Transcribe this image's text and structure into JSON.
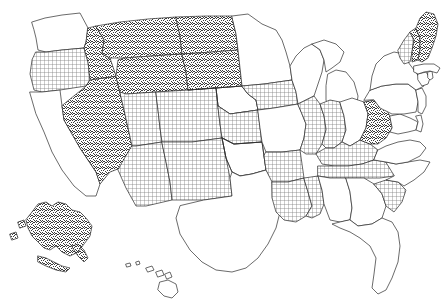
{
  "map": {
    "title": "United States Choropleth Map",
    "projection": "albers-usa",
    "background_color": "#ffffff",
    "outline_color": "#2b2b2b",
    "legend_categories": [
      {
        "key": "stipple",
        "label": "Stippled",
        "pattern": "random-dot-noise",
        "color": "#5a5a5a"
      },
      {
        "key": "crosshatch",
        "label": "Crosshatched",
        "pattern": "fine-grid",
        "color": "#8a8a8a"
      },
      {
        "key": "none",
        "label": "Unfilled",
        "pattern": "solid-white",
        "color": "#ffffff"
      }
    ]
  },
  "chart_data": {
    "type": "map",
    "xlabel": "",
    "ylabel": "",
    "categories": [
      "stipple",
      "crosshatch",
      "none"
    ],
    "counts": {
      "stipple": 12,
      "crosshatch": 17,
      "none": 22
    },
    "states": [
      {
        "code": "WA",
        "name": "Washington",
        "fill": "none"
      },
      {
        "code": "OR",
        "name": "Oregon",
        "fill": "crosshatch"
      },
      {
        "code": "CA",
        "name": "California",
        "fill": "none"
      },
      {
        "code": "NV",
        "name": "Nevada",
        "fill": "stipple"
      },
      {
        "code": "ID",
        "name": "Idaho",
        "fill": "stipple"
      },
      {
        "code": "MT",
        "name": "Montana",
        "fill": "stipple"
      },
      {
        "code": "WY",
        "name": "Wyoming",
        "fill": "stipple"
      },
      {
        "code": "UT",
        "name": "Utah",
        "fill": "crosshatch"
      },
      {
        "code": "AZ",
        "name": "Arizona",
        "fill": "crosshatch"
      },
      {
        "code": "CO",
        "name": "Colorado",
        "fill": "crosshatch"
      },
      {
        "code": "NM",
        "name": "New Mexico",
        "fill": "crosshatch"
      },
      {
        "code": "ND",
        "name": "North Dakota",
        "fill": "stipple"
      },
      {
        "code": "SD",
        "name": "South Dakota",
        "fill": "stipple"
      },
      {
        "code": "NE",
        "name": "Nebraska",
        "fill": "crosshatch"
      },
      {
        "code": "KS",
        "name": "Kansas",
        "fill": "crosshatch"
      },
      {
        "code": "OK",
        "name": "Oklahoma",
        "fill": "stipple"
      },
      {
        "code": "TX",
        "name": "Texas",
        "fill": "none"
      },
      {
        "code": "MN",
        "name": "Minnesota",
        "fill": "none"
      },
      {
        "code": "IA",
        "name": "Iowa",
        "fill": "crosshatch"
      },
      {
        "code": "MO",
        "name": "Missouri",
        "fill": "none"
      },
      {
        "code": "AR",
        "name": "Arkansas",
        "fill": "crosshatch"
      },
      {
        "code": "LA",
        "name": "Louisiana",
        "fill": "crosshatch"
      },
      {
        "code": "WI",
        "name": "Wisconsin",
        "fill": "none"
      },
      {
        "code": "IL",
        "name": "Illinois",
        "fill": "crosshatch"
      },
      {
        "code": "MS",
        "name": "Mississippi",
        "fill": "crosshatch"
      },
      {
        "code": "MI",
        "name": "Michigan",
        "fill": "none"
      },
      {
        "code": "IN",
        "name": "Indiana",
        "fill": "crosshatch"
      },
      {
        "code": "OH",
        "name": "Ohio",
        "fill": "none"
      },
      {
        "code": "KY",
        "name": "Kentucky",
        "fill": "crosshatch"
      },
      {
        "code": "TN",
        "name": "Tennessee",
        "fill": "crosshatch"
      },
      {
        "code": "AL",
        "name": "Alabama",
        "fill": "none"
      },
      {
        "code": "GA",
        "name": "Georgia",
        "fill": "none"
      },
      {
        "code": "FL",
        "name": "Florida",
        "fill": "none"
      },
      {
        "code": "SC",
        "name": "South Carolina",
        "fill": "crosshatch"
      },
      {
        "code": "NC",
        "name": "North Carolina",
        "fill": "none"
      },
      {
        "code": "VA",
        "name": "Virginia",
        "fill": "none"
      },
      {
        "code": "WV",
        "name": "West Virginia",
        "fill": "stipple"
      },
      {
        "code": "MD",
        "name": "Maryland",
        "fill": "none"
      },
      {
        "code": "DE",
        "name": "Delaware",
        "fill": "none"
      },
      {
        "code": "PA",
        "name": "Pennsylvania",
        "fill": "none"
      },
      {
        "code": "NJ",
        "name": "New Jersey",
        "fill": "none"
      },
      {
        "code": "NY",
        "name": "New York",
        "fill": "none"
      },
      {
        "code": "CT",
        "name": "Connecticut",
        "fill": "none"
      },
      {
        "code": "RI",
        "name": "Rhode Island",
        "fill": "none"
      },
      {
        "code": "MA",
        "name": "Massachusetts",
        "fill": "none"
      },
      {
        "code": "VT",
        "name": "Vermont",
        "fill": "crosshatch"
      },
      {
        "code": "NH",
        "name": "New Hampshire",
        "fill": "stipple"
      },
      {
        "code": "ME",
        "name": "Maine",
        "fill": "stipple"
      },
      {
        "code": "AK",
        "name": "Alaska",
        "fill": "stipple"
      },
      {
        "code": "HI",
        "name": "Hawaii",
        "fill": "none"
      }
    ]
  }
}
